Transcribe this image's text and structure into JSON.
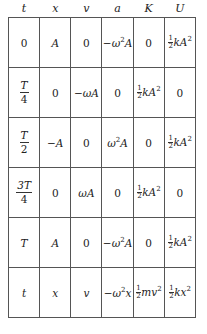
{
  "table": {
    "headers": [
      "t",
      "x",
      "v",
      "a",
      "K",
      "U"
    ],
    "rows": [
      {
        "t": "0",
        "x": "A",
        "v": "0",
        "a": "−ω²A",
        "K": "0",
        "U": "½kA²"
      },
      {
        "t": "T/4",
        "x": "0",
        "v": "−ωA",
        "a": "0",
        "K": "½kA²",
        "U": "0"
      },
      {
        "t": "T/2",
        "x": "−A",
        "v": "0",
        "a": "ω²A",
        "K": "0",
        "U": "½kA²"
      },
      {
        "t": "3T/4",
        "x": "0",
        "v": "ωA",
        "a": "0",
        "K": "½kA²",
        "U": "0"
      },
      {
        "t": "T",
        "x": "A",
        "v": "0",
        "a": "−ω²A",
        "K": "0",
        "U": "½kA²"
      },
      {
        "t": "t",
        "x": "x",
        "v": "v",
        "a": "−ω²x",
        "K": "½mv²",
        "U": "½kx²"
      }
    ],
    "parts": {
      "neg": "−",
      "omega": "ω",
      "two": "2",
      "A": "A",
      "k": "k",
      "m": "m",
      "v": "v",
      "x": "x",
      "T": "T",
      "threeT": "3T",
      "four": "4",
      "one": "1",
      "zero": "0",
      "t": "t"
    }
  }
}
